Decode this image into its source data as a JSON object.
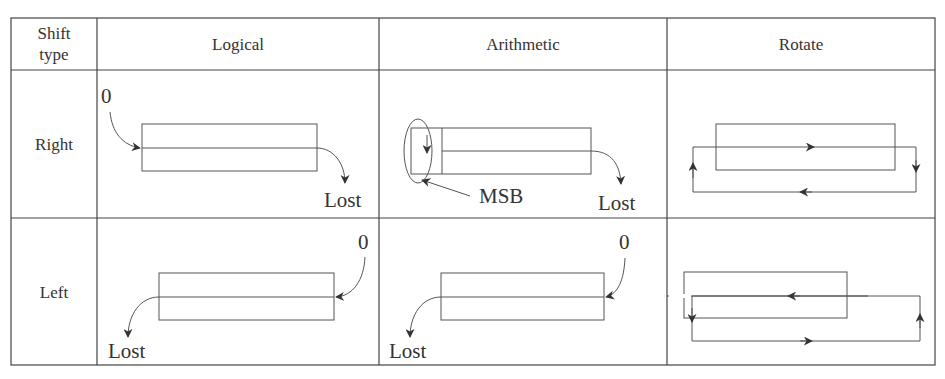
{
  "table": {
    "corner_header": {
      "line1": "Shift",
      "line2": "type"
    },
    "columns": [
      "Logical",
      "Arithmetic",
      "Rotate"
    ],
    "rows": [
      "Right",
      "Left"
    ]
  },
  "cells": {
    "right_logical": {
      "input": "0",
      "output": "Lost"
    },
    "right_arithmetic": {
      "annotation": "MSB",
      "output": "Lost"
    },
    "right_rotate": {},
    "left_logical": {
      "input": "0",
      "output": "Lost"
    },
    "left_arithmetic": {
      "input": "0",
      "output": "Lost"
    },
    "left_rotate": {}
  }
}
